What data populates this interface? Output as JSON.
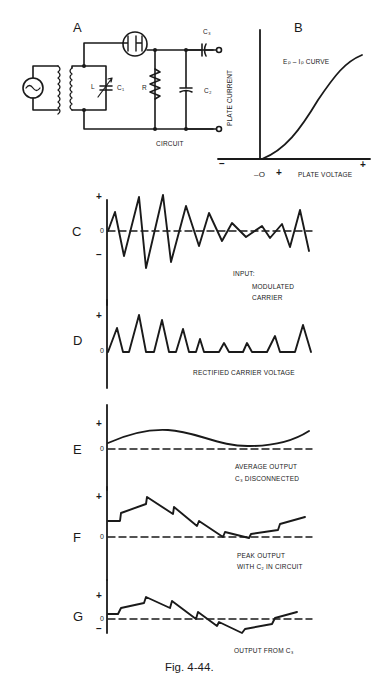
{
  "figure": {
    "caption": "Fig. 4-44.",
    "panel_a": {
      "letter": "A",
      "title": "CIRCUIT",
      "components": {
        "inductor": "L",
        "variable_capacitor": "C₁",
        "resistor": "R",
        "shunt_capacitor": "C₂",
        "coupling_capacitor": "C₃"
      }
    },
    "panel_b": {
      "letter": "B",
      "curve_label": "Eₚ – Iₚ  CURVE",
      "ylabel": "PLATE CURRENT",
      "xlabel": "PLATE VOLTAGE",
      "tick_minus": "–",
      "tick_zero": "–O",
      "tick_plus": "+",
      "tick_end_plus": "+"
    },
    "waveforms": [
      {
        "letter": "C",
        "plus": "+",
        "zero": "0",
        "minus": "–",
        "caption_lines": [
          "INPUT:",
          "MODULATED",
          "CARRIER"
        ]
      },
      {
        "letter": "D",
        "plus": "+",
        "zero": "0",
        "caption_lines": [
          "RECTIFIED CARRIER VOLTAGE"
        ]
      },
      {
        "letter": "E",
        "plus": "+",
        "zero": "0",
        "caption_lines": [
          "AVERAGE OUTPUT",
          "C₃ DISCONNECTED"
        ]
      },
      {
        "letter": "F",
        "plus": "+",
        "zero": "0",
        "caption_lines": [
          "PEAK OUTPUT",
          "WITH C₂ IN CIRCUIT"
        ]
      },
      {
        "letter": "G",
        "plus": "+",
        "zero": "0",
        "minus": "–",
        "caption_lines": [
          "OUTPUT FROM C₃"
        ]
      }
    ]
  },
  "colors": {
    "ink": "#1a1a1a",
    "paper": "#ffffff"
  }
}
